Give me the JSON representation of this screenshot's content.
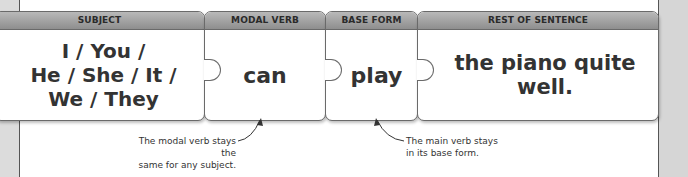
{
  "columns": [
    {
      "header": "SUBJECT",
      "text": "I / You /\nHe / She / It /\nWe / They"
    },
    {
      "header": "MODAL VERB",
      "text": "can"
    },
    {
      "header": "BASE FORM",
      "text": "play"
    },
    {
      "header": "REST OF SENTENCE",
      "text": "the piano quite well."
    }
  ],
  "annotations": {
    "modal": "The modal verb stays the same for any subject.",
    "modal_line1": "The modal verb stays the",
    "modal_line2": "same for any subject.",
    "base_line1": "The main verb stays",
    "base_line2": "in its base form."
  },
  "colors": {
    "header_bar": "#9e9e9e",
    "text": "#333333",
    "side_strip": "#dcdcdc"
  }
}
